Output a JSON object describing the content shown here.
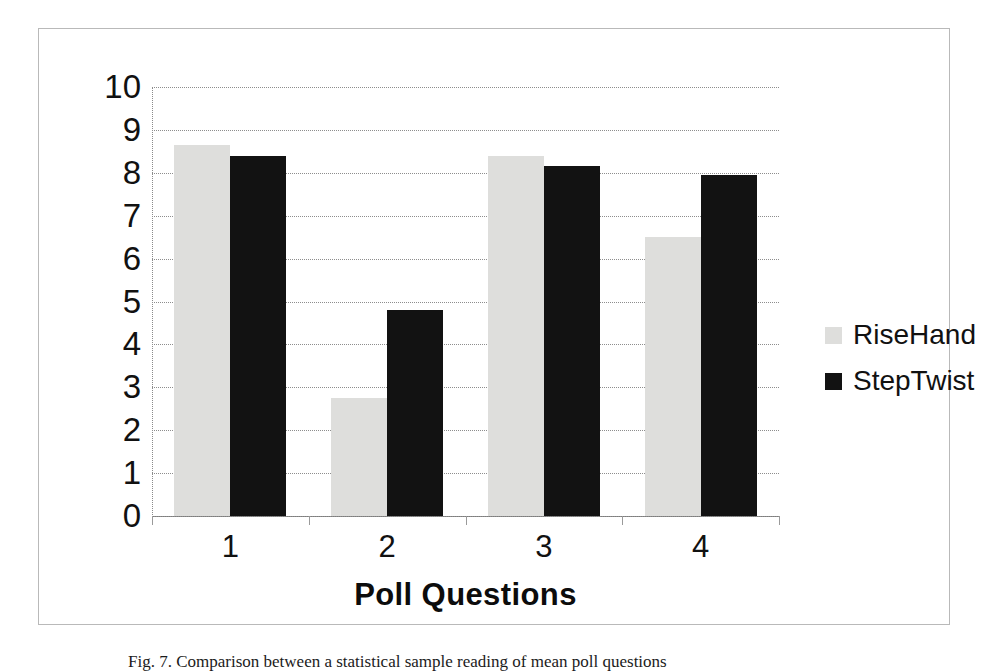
{
  "figure": {
    "caption_label": "Fig. 7.",
    "caption_text": "Comparison between a statistical sample reading of mean poll questions"
  },
  "chart_data": {
    "type": "bar",
    "title": "",
    "xlabel": "Poll Questions",
    "ylabel": "",
    "categories": [
      "1",
      "2",
      "3",
      "4"
    ],
    "series": [
      {
        "name": "RiseHand",
        "color": "#dededc",
        "values": [
          8.65,
          2.75,
          8.4,
          6.5
        ]
      },
      {
        "name": "StepTwist",
        "color": "#121212",
        "values": [
          8.4,
          4.8,
          8.15,
          7.95
        ]
      }
    ],
    "ylim": [
      0,
      10
    ],
    "ytick_labels": [
      "10",
      "9",
      "8",
      "7",
      "6",
      "5",
      "4",
      "3",
      "2",
      "1",
      "0"
    ],
    "ytick_values": [
      10,
      9,
      8,
      7,
      6,
      5,
      4,
      3,
      2,
      1,
      0
    ],
    "grid": true,
    "grid_style": "dotted-horizontal",
    "legend_position": "right",
    "legend_entries": [
      "RiseHand",
      "StepTwist"
    ]
  }
}
